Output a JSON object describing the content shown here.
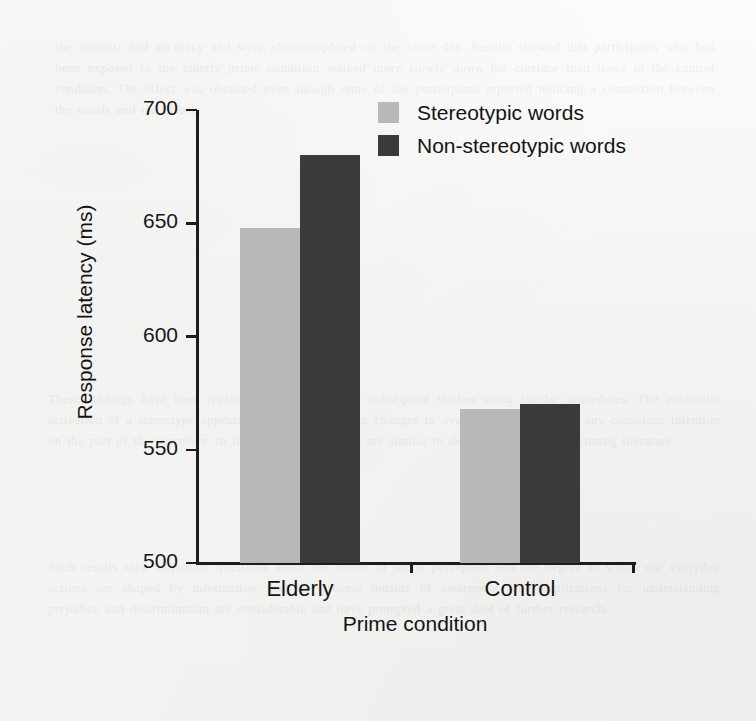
{
  "chart_data": {
    "type": "bar",
    "title": "",
    "xlabel": "Prime condition",
    "ylabel": "Response latency (ms)",
    "categories": [
      "Elderly",
      "Control"
    ],
    "series": [
      {
        "name": "Stereotypic words",
        "values": [
          648,
          568
        ],
        "color": "#b8b8b8"
      },
      {
        "name": "Non-stereotypic words",
        "values": [
          680,
          570
        ],
        "color": "#3a3a3a"
      }
    ],
    "ylim": [
      500,
      700
    ],
    "yticks": [
      500,
      550,
      600,
      650,
      700
    ],
    "ytick_labels": [
      "500",
      "550",
      "600",
      "650",
      "700"
    ],
    "grid": false,
    "legend_position": "top-right"
  },
  "legend": {
    "items": [
      {
        "label": "Stereotypic words",
        "color": "#b8b8b8"
      },
      {
        "label": "Non-stereotypic words",
        "color": "#3a3a3a"
      }
    ]
  },
  "ghost_text": {
    "top": "the contrast and accuracy and were also completed on the same day. Results showed that participants who had been exposed to the elderly prime condition walked more slowly down the corridor than those in the control condition. The effect was obtained even though none of the participants reported noticing a connection between the words and the elderly.",
    "middle": "These findings have been replicated in a number of subsequent studies using similar procedures. The automatic activation of a stereotype appears sufficient to produce changes in overt behaviour without any conscious intention on the part of the perceiver. In this respect the effects are similar to those reported in the priming literature.",
    "bottom": "Such results raise important questions about the nature of social perception and the degree to which our everyday actions are shaped by information that we process outside of awareness. The implications for understanding prejudice and discrimination are considerable and have prompted a great deal of further research."
  }
}
